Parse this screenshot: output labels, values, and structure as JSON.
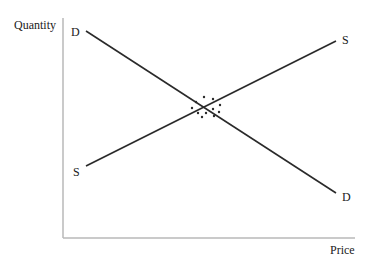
{
  "diagram": {
    "y_axis_label": "Quantity",
    "x_axis_label": "Price",
    "curves": [
      {
        "name": "demand",
        "start_label": "D",
        "end_label": "D"
      },
      {
        "name": "supply",
        "start_label": "S",
        "end_label": "S"
      }
    ],
    "equilibrium_marker": "dotted-circle",
    "colors": {
      "line": "#2a2a2a",
      "axis": "#b8b8b8",
      "text": "#1a1a1a"
    }
  }
}
